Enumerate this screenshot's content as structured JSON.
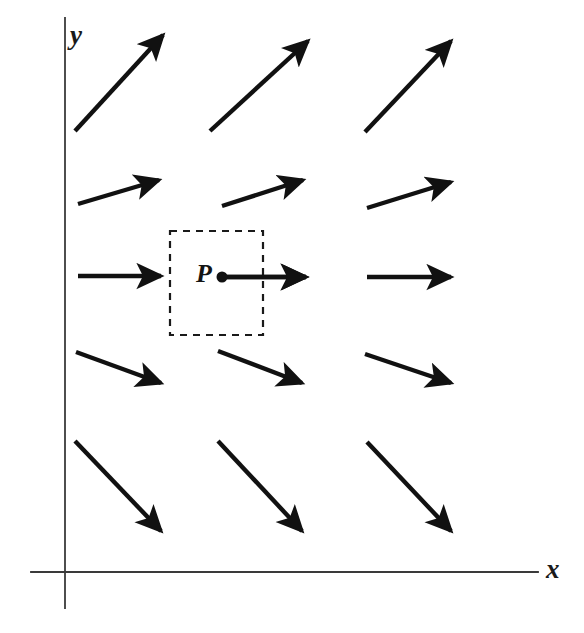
{
  "figure": {
    "width": 584,
    "height": 633,
    "background_color": "#ffffff",
    "ink_color": "#111111",
    "axis_color": "#3a3a3a"
  },
  "axes": {
    "x_label": "x",
    "y_label": "y",
    "origin": {
      "x": 65,
      "y": 572
    },
    "x_axis": {
      "x1": 31,
      "y1": 572,
      "x2": 538,
      "y2": 572
    },
    "y_axis": {
      "x1": 65,
      "y1": 18,
      "x2": 65,
      "y2": 608
    },
    "x_label_pos": {
      "x": 552,
      "y": 572
    },
    "y_label_pos": {
      "x": 79,
      "y": 36
    }
  },
  "point": {
    "label": "P",
    "dot": {
      "x": 222,
      "y": 277,
      "r": 5.5
    },
    "label_pos": {
      "x": 205,
      "y": 274
    }
  },
  "dashed_region": {
    "name": "dashed-rectangle",
    "x": 170,
    "y": 231,
    "width": 93,
    "height": 104,
    "dash": "7 6",
    "stroke_width": 2.2
  },
  "chart_data": {
    "type": "scatter",
    "xlabel": "x",
    "ylabel": "y",
    "grid": false,
    "legend": null,
    "vectors": [
      {
        "row": 1,
        "col": 1,
        "x1": 75,
        "y1": 131,
        "x2": 163,
        "y2": 35,
        "angle_deg": 47.5,
        "length": 130
      },
      {
        "row": 1,
        "col": 2,
        "x1": 210,
        "y1": 131,
        "x2": 308,
        "y2": 41,
        "angle_deg": 42.6,
        "length": 133
      },
      {
        "row": 1,
        "col": 3,
        "x1": 365,
        "y1": 132,
        "x2": 451,
        "y2": 41,
        "angle_deg": 46.6,
        "length": 125
      },
      {
        "row": 2,
        "col": 1,
        "x1": 78,
        "y1": 204,
        "x2": 159,
        "y2": 180,
        "angle_deg": 16.5,
        "length": 84
      },
      {
        "row": 2,
        "col": 2,
        "x1": 222,
        "y1": 206,
        "x2": 303,
        "y2": 180,
        "angle_deg": 17.8,
        "length": 85
      },
      {
        "row": 2,
        "col": 3,
        "x1": 367,
        "y1": 208,
        "x2": 451,
        "y2": 182,
        "angle_deg": 17.2,
        "length": 88
      },
      {
        "row": 3,
        "col": 1,
        "x1": 78,
        "y1": 276,
        "x2": 161,
        "y2": 276,
        "angle_deg": 0,
        "length": 83
      },
      {
        "row": 3,
        "col": 2,
        "x1": 222,
        "y1": 277,
        "x2": 306,
        "y2": 277,
        "angle_deg": 0,
        "length": 84
      },
      {
        "row": 3,
        "col": 3,
        "x1": 367,
        "y1": 277,
        "x2": 451,
        "y2": 277,
        "angle_deg": 0,
        "length": 84
      },
      {
        "row": 4,
        "col": 1,
        "x1": 76,
        "y1": 352,
        "x2": 161,
        "y2": 383,
        "angle_deg": -20.0,
        "length": 90
      },
      {
        "row": 4,
        "col": 2,
        "x1": 218,
        "y1": 351,
        "x2": 302,
        "y2": 383,
        "angle_deg": -20.8,
        "length": 90
      },
      {
        "row": 4,
        "col": 3,
        "x1": 365,
        "y1": 354,
        "x2": 451,
        "y2": 383,
        "angle_deg": -18.6,
        "length": 91
      },
      {
        "row": 5,
        "col": 1,
        "x1": 75,
        "y1": 441,
        "x2": 161,
        "y2": 531,
        "angle_deg": -46.3,
        "length": 124
      },
      {
        "row": 5,
        "col": 2,
        "x1": 218,
        "y1": 441,
        "x2": 302,
        "y2": 531,
        "angle_deg": -47.0,
        "length": 123
      },
      {
        "row": 5,
        "col": 3,
        "x1": 367,
        "y1": 442,
        "x2": 451,
        "y2": 531,
        "angle_deg": -46.6,
        "length": 122
      }
    ],
    "point_vector": {
      "x1": 222,
      "y1": 277,
      "x2": 306,
      "y2": 277,
      "angle_deg": 0,
      "length": 84,
      "origin_label": "P"
    }
  }
}
